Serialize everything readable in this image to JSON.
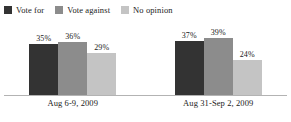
{
  "chart_data": {
    "type": "bar",
    "title": "",
    "subtitle": "",
    "xlabel": "",
    "ylabel": "",
    "ylim": [
      0,
      50
    ],
    "grid": false,
    "legend_position": "top-left",
    "value_suffix": "%",
    "categories": [
      "Aug 6-9, 2009",
      "Aug 31-Sep 2, 2009"
    ],
    "series": [
      {
        "name": "Vote for",
        "color": "#333333",
        "values": [
          35,
          36
        ],
        "labels": [
          "35%",
          "37%"
        ]
      },
      {
        "name": "Vote against",
        "color": "#8c8c8c",
        "values": [
          36,
          39
        ],
        "labels": [
          "36%",
          "39%"
        ]
      },
      {
        "name": "No opinion",
        "color": "#c4c4c4",
        "values": [
          29,
          24
        ],
        "labels": [
          "29%",
          "24%"
        ]
      }
    ],
    "groups": [
      {
        "category": "Aug 6-9, 2009",
        "bars": [
          {
            "series": "Vote for",
            "value": 35,
            "label": "35%",
            "color": "#333333"
          },
          {
            "series": "Vote against",
            "value": 36,
            "label": "36%",
            "color": "#8c8c8c"
          },
          {
            "series": "No opinion",
            "value": 29,
            "label": "29%",
            "color": "#c4c4c4"
          }
        ]
      },
      {
        "category": "Aug 31-Sep 2, 2009",
        "bars": [
          {
            "series": "Vote for",
            "value": 37,
            "label": "37%",
            "color": "#333333"
          },
          {
            "series": "Vote against",
            "value": 39,
            "label": "39%",
            "color": "#8c8c8c"
          },
          {
            "series": "No opinion",
            "value": 24,
            "label": "24%",
            "color": "#c4c4c4"
          }
        ]
      }
    ]
  },
  "legend": {
    "items": [
      {
        "label": "Vote for",
        "color": "#333333"
      },
      {
        "label": "Vote against",
        "color": "#8c8c8c"
      },
      {
        "label": "No opinion",
        "color": "#c4c4c4"
      }
    ]
  },
  "colors": {
    "background": "#ffffff",
    "text": "#1a1a1a",
    "axis": "#b3b3b3",
    "vote_for": "#333333",
    "vote_against": "#8c8c8c",
    "no_opinion": "#c4c4c4"
  }
}
